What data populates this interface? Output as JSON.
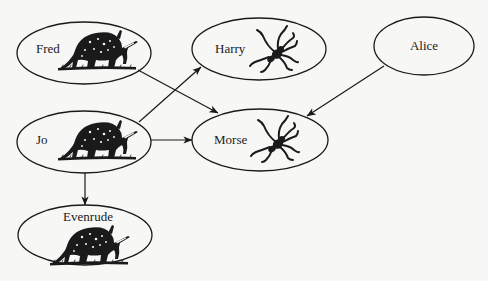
{
  "diagram": {
    "background": "#f7f7f5",
    "ink_color": "#1a1a1a",
    "nodes": [
      {
        "id": "fred",
        "label": "Fred",
        "icon": "aardvark-icon",
        "cx": 84,
        "cy": 53,
        "rx": 67,
        "ry": 31
      },
      {
        "id": "harry",
        "label": "Harry",
        "icon": "spider-icon",
        "cx": 259,
        "cy": 49,
        "rx": 67,
        "ry": 31
      },
      {
        "id": "alice",
        "label": "Alice",
        "icon": null,
        "cx": 424,
        "cy": 46,
        "rx": 50,
        "ry": 29
      },
      {
        "id": "jo",
        "label": "Jo",
        "icon": "aardvark-icon",
        "cx": 84,
        "cy": 142,
        "rx": 67,
        "ry": 31
      },
      {
        "id": "morse",
        "label": "Morse",
        "icon": "spider-icon",
        "cx": 260,
        "cy": 140,
        "rx": 68,
        "ry": 31
      },
      {
        "id": "evenrude",
        "label": "Evenrude",
        "icon": "aardvark-icon",
        "cx": 85,
        "cy": 235,
        "rx": 67,
        "ry": 30
      }
    ],
    "edges": [
      {
        "from": "Fred",
        "to": "Morse"
      },
      {
        "from": "Jo",
        "to": "Harry"
      },
      {
        "from": "Jo",
        "to": "Morse"
      },
      {
        "from": "Jo",
        "to": "Evenrude"
      },
      {
        "from": "Alice",
        "to": "Morse"
      }
    ]
  }
}
